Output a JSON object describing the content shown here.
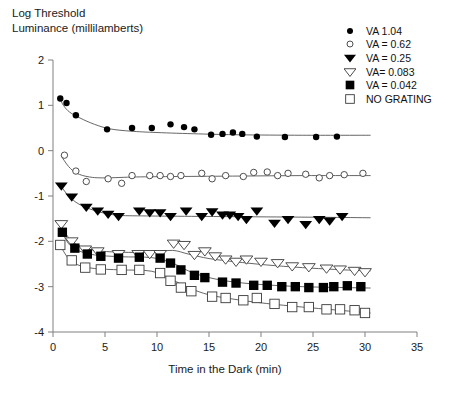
{
  "chart_data": {
    "type": "scatter",
    "title": "",
    "ylabel_line1": "Log Threshold",
    "ylabel_line2": "Luminance (millilamberts)",
    "xlabel": "Time in the Dark (min)",
    "xlim": [
      0,
      35
    ],
    "ylim": [
      -4,
      2
    ],
    "xticks": [
      0,
      5,
      10,
      15,
      20,
      25,
      30,
      35
    ],
    "yticks": [
      2,
      1,
      0,
      -1,
      -2,
      -3,
      -4
    ],
    "xtick_labels": [
      "0",
      "5",
      "10",
      "15",
      "20",
      "25",
      "30",
      "35"
    ],
    "ytick_labels": [
      "2",
      "1",
      "0",
      "-1",
      "-2",
      "-3",
      "-4"
    ],
    "grid": false,
    "legend_position": "top-right",
    "series": [
      {
        "name": "VA 1.04",
        "marker": "filled-circle",
        "color": "#000000",
        "points": [
          [
            0.7,
            1.15
          ],
          [
            1.3,
            1.05
          ],
          [
            2.2,
            0.78
          ],
          [
            5.2,
            0.47
          ],
          [
            7.6,
            0.5
          ],
          [
            9.5,
            0.5
          ],
          [
            11.3,
            0.58
          ],
          [
            12.6,
            0.52
          ],
          [
            13.6,
            0.47
          ],
          [
            15.2,
            0.35
          ],
          [
            16.3,
            0.37
          ],
          [
            17.3,
            0.4
          ],
          [
            18.2,
            0.37
          ],
          [
            19.6,
            0.31
          ],
          [
            22.3,
            0.3
          ],
          [
            25.3,
            0.3
          ],
          [
            27.3,
            0.31
          ]
        ],
        "fit": [
          [
            0.6,
            1.18
          ],
          [
            1.0,
            1.0
          ],
          [
            1.6,
            0.85
          ],
          [
            2.6,
            0.72
          ],
          [
            4.0,
            0.58
          ],
          [
            5.5,
            0.48
          ],
          [
            7.5,
            0.43
          ],
          [
            10.0,
            0.4
          ],
          [
            14.0,
            0.37
          ],
          [
            18.0,
            0.35
          ],
          [
            24.0,
            0.34
          ],
          [
            30.5,
            0.34
          ]
        ]
      },
      {
        "name": "VA = 0.62",
        "marker": "open-circle",
        "color": "#3a3a3a",
        "points": [
          [
            1.1,
            -0.1
          ],
          [
            2.2,
            -0.45
          ],
          [
            3.2,
            -0.68
          ],
          [
            5.3,
            -0.62
          ],
          [
            6.6,
            -0.72
          ],
          [
            7.6,
            -0.55
          ],
          [
            9.3,
            -0.55
          ],
          [
            10.3,
            -0.55
          ],
          [
            11.3,
            -0.57
          ],
          [
            12.3,
            -0.55
          ],
          [
            14.3,
            -0.5
          ],
          [
            15.3,
            -0.62
          ],
          [
            16.6,
            -0.55
          ],
          [
            18.3,
            -0.57
          ],
          [
            19.3,
            -0.48
          ],
          [
            20.6,
            -0.47
          ],
          [
            21.6,
            -0.55
          ],
          [
            22.6,
            -0.5
          ],
          [
            24.3,
            -0.52
          ],
          [
            25.6,
            -0.6
          ],
          [
            26.6,
            -0.55
          ],
          [
            28.0,
            -0.53
          ],
          [
            29.8,
            -0.5
          ]
        ],
        "fit": [
          [
            0.8,
            -0.12
          ],
          [
            1.5,
            -0.35
          ],
          [
            2.3,
            -0.5
          ],
          [
            3.5,
            -0.58
          ],
          [
            5.0,
            -0.6
          ],
          [
            8.0,
            -0.58
          ],
          [
            12.0,
            -0.57
          ],
          [
            18.0,
            -0.56
          ],
          [
            24.0,
            -0.55
          ],
          [
            30.5,
            -0.55
          ]
        ]
      },
      {
        "name": "VA = 0.25",
        "marker": "filled-triangle-down",
        "color": "#000000",
        "points": [
          [
            0.8,
            -0.78
          ],
          [
            1.8,
            -1.02
          ],
          [
            3.2,
            -1.25
          ],
          [
            4.3,
            -1.33
          ],
          [
            5.3,
            -1.4
          ],
          [
            6.3,
            -1.45
          ],
          [
            8.3,
            -1.33
          ],
          [
            9.3,
            -1.37
          ],
          [
            10.3,
            -1.37
          ],
          [
            11.3,
            -1.45
          ],
          [
            12.8,
            -1.33
          ],
          [
            14.3,
            -1.45
          ],
          [
            15.3,
            -1.35
          ],
          [
            16.3,
            -1.42
          ],
          [
            17.0,
            -1.42
          ],
          [
            17.8,
            -1.45
          ],
          [
            18.6,
            -1.52
          ],
          [
            19.6,
            -1.33
          ],
          [
            21.3,
            -1.6
          ],
          [
            22.6,
            -1.52
          ],
          [
            24.3,
            -1.63
          ],
          [
            25.6,
            -1.52
          ],
          [
            26.6,
            -1.55
          ],
          [
            27.8,
            -1.45
          ]
        ],
        "fit": [
          [
            0.7,
            -0.76
          ],
          [
            1.5,
            -1.0
          ],
          [
            2.5,
            -1.18
          ],
          [
            4.0,
            -1.32
          ],
          [
            6.0,
            -1.42
          ],
          [
            9.0,
            -1.44
          ],
          [
            14.0,
            -1.45
          ],
          [
            20.0,
            -1.46
          ],
          [
            26.0,
            -1.47
          ],
          [
            30.5,
            -1.48
          ]
        ]
      },
      {
        "name": "VA= 0.083",
        "marker": "open-triangle-down",
        "color": "#3a3a3a",
        "points": [
          [
            0.8,
            -1.62
          ],
          [
            1.8,
            -2.0
          ],
          [
            3.1,
            -2.18
          ],
          [
            4.3,
            -2.22
          ],
          [
            6.3,
            -2.28
          ],
          [
            8.2,
            -2.28
          ],
          [
            9.3,
            -2.28
          ],
          [
            10.3,
            -2.28
          ],
          [
            11.6,
            -2.05
          ],
          [
            12.6,
            -2.08
          ],
          [
            13.6,
            -2.3
          ],
          [
            14.6,
            -2.22
          ],
          [
            15.6,
            -2.33
          ],
          [
            16.6,
            -2.4
          ],
          [
            17.6,
            -2.45
          ],
          [
            18.6,
            -2.4
          ],
          [
            20.0,
            -2.45
          ],
          [
            21.6,
            -2.48
          ],
          [
            23.0,
            -2.55
          ],
          [
            24.6,
            -2.57
          ],
          [
            26.3,
            -2.6
          ],
          [
            27.6,
            -2.62
          ],
          [
            29.0,
            -2.65
          ],
          [
            30.0,
            -2.68
          ]
        ],
        "fit": [
          [
            0.7,
            -1.6
          ],
          [
            1.5,
            -1.92
          ],
          [
            2.5,
            -2.1
          ],
          [
            4.0,
            -2.2
          ],
          [
            6.5,
            -2.24
          ],
          [
            9.5,
            -2.24
          ],
          [
            11.5,
            -2.2
          ],
          [
            13.0,
            -2.28
          ],
          [
            15.0,
            -2.38
          ],
          [
            17.5,
            -2.45
          ],
          [
            20.5,
            -2.52
          ],
          [
            24.0,
            -2.58
          ],
          [
            28.0,
            -2.63
          ],
          [
            30.5,
            -2.65
          ]
        ]
      },
      {
        "name": "VA = 0.042",
        "marker": "filled-square",
        "color": "#000000",
        "points": [
          [
            0.9,
            -1.8
          ],
          [
            2.1,
            -2.15
          ],
          [
            3.3,
            -2.28
          ],
          [
            4.6,
            -2.33
          ],
          [
            6.3,
            -2.37
          ],
          [
            8.3,
            -2.35
          ],
          [
            10.3,
            -2.37
          ],
          [
            11.3,
            -2.48
          ],
          [
            12.3,
            -2.63
          ],
          [
            13.6,
            -2.75
          ],
          [
            14.6,
            -2.8
          ],
          [
            16.3,
            -2.9
          ],
          [
            17.6,
            -2.92
          ],
          [
            19.3,
            -2.97
          ],
          [
            20.6,
            -2.97
          ],
          [
            22.0,
            -3.0
          ],
          [
            23.3,
            -3.0
          ],
          [
            24.6,
            -3.02
          ],
          [
            26.0,
            -3.02
          ],
          [
            27.0,
            -3.0
          ],
          [
            28.3,
            -2.98
          ],
          [
            29.6,
            -3.0
          ]
        ],
        "fit": [
          [
            0.8,
            -1.78
          ],
          [
            1.6,
            -2.08
          ],
          [
            2.6,
            -2.22
          ],
          [
            4.0,
            -2.3
          ],
          [
            6.5,
            -2.34
          ],
          [
            9.5,
            -2.36
          ],
          [
            11.5,
            -2.48
          ],
          [
            13.0,
            -2.65
          ],
          [
            15.0,
            -2.8
          ],
          [
            17.5,
            -2.9
          ],
          [
            20.5,
            -2.96
          ],
          [
            24.0,
            -3.0
          ],
          [
            28.0,
            -3.02
          ],
          [
            30.5,
            -3.03
          ]
        ]
      },
      {
        "name": "NO GRATING",
        "marker": "open-square",
        "color": "#3a3a3a",
        "points": [
          [
            0.7,
            -2.08
          ],
          [
            1.8,
            -2.42
          ],
          [
            3.1,
            -2.58
          ],
          [
            4.6,
            -2.62
          ],
          [
            6.6,
            -2.63
          ],
          [
            8.3,
            -2.63
          ],
          [
            10.3,
            -2.7
          ],
          [
            11.3,
            -2.87
          ],
          [
            12.3,
            -3.02
          ],
          [
            13.3,
            -3.1
          ],
          [
            15.3,
            -3.22
          ],
          [
            16.6,
            -3.25
          ],
          [
            18.3,
            -3.3
          ],
          [
            19.6,
            -3.25
          ],
          [
            21.3,
            -3.38
          ],
          [
            23.0,
            -3.45
          ],
          [
            24.6,
            -3.45
          ],
          [
            26.3,
            -3.5
          ],
          [
            27.6,
            -3.5
          ],
          [
            29.0,
            -3.52
          ],
          [
            30.0,
            -3.58
          ]
        ],
        "fit": [
          [
            0.6,
            -2.05
          ],
          [
            1.4,
            -2.35
          ],
          [
            2.4,
            -2.52
          ],
          [
            4.0,
            -2.6
          ],
          [
            6.5,
            -2.63
          ],
          [
            9.5,
            -2.66
          ],
          [
            11.5,
            -2.85
          ],
          [
            13.0,
            -3.02
          ],
          [
            15.0,
            -3.18
          ],
          [
            17.5,
            -3.28
          ],
          [
            20.5,
            -3.37
          ],
          [
            24.0,
            -3.45
          ],
          [
            28.0,
            -3.53
          ],
          [
            30.5,
            -3.58
          ]
        ]
      }
    ]
  },
  "axes": {
    "ylabel_line1": "Log Threshold",
    "ylabel_line2": "Luminance (millilamberts)",
    "xlabel": "Time in the Dark (min)"
  },
  "legend": {
    "items": [
      {
        "label": "VA 1.04",
        "marker": "filled-circle"
      },
      {
        "label": "VA = 0.62",
        "marker": "open-circle"
      },
      {
        "label": "VA = 0.25",
        "marker": "filled-triangle-down"
      },
      {
        "label": "VA= 0.083",
        "marker": "open-triangle-down"
      },
      {
        "label": "VA = 0.042",
        "marker": "filled-square"
      },
      {
        "label": "NO GRATING",
        "marker": "open-square"
      }
    ]
  },
  "colors": {
    "axis": "#808080",
    "text": "#1a1a1a",
    "filled": "#000000",
    "open": "#3a3a3a"
  }
}
